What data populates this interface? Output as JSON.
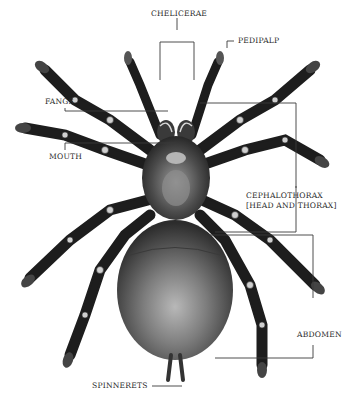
{
  "figure": {
    "colors": {
      "background": "#ffffff",
      "body_dark": "#2a2a2a",
      "body_mid": "#6a6a6a",
      "abdomen_light": "#a9a9a9",
      "leader_line": "#3a3a3a",
      "label_text": "#2b2b2b"
    }
  },
  "labels": {
    "chelicerae": "CHELICERAE",
    "pedipalp": "PEDIPALP",
    "fangs": "FANGS",
    "mouth": "MOUTH",
    "cephalothorax_line1": "CEPHALOTHORAX",
    "cephalothorax_line2": "[HEAD AND THORAX]",
    "abdomen": "ABDOMEN",
    "spinnerets": "SPINNERETS"
  }
}
